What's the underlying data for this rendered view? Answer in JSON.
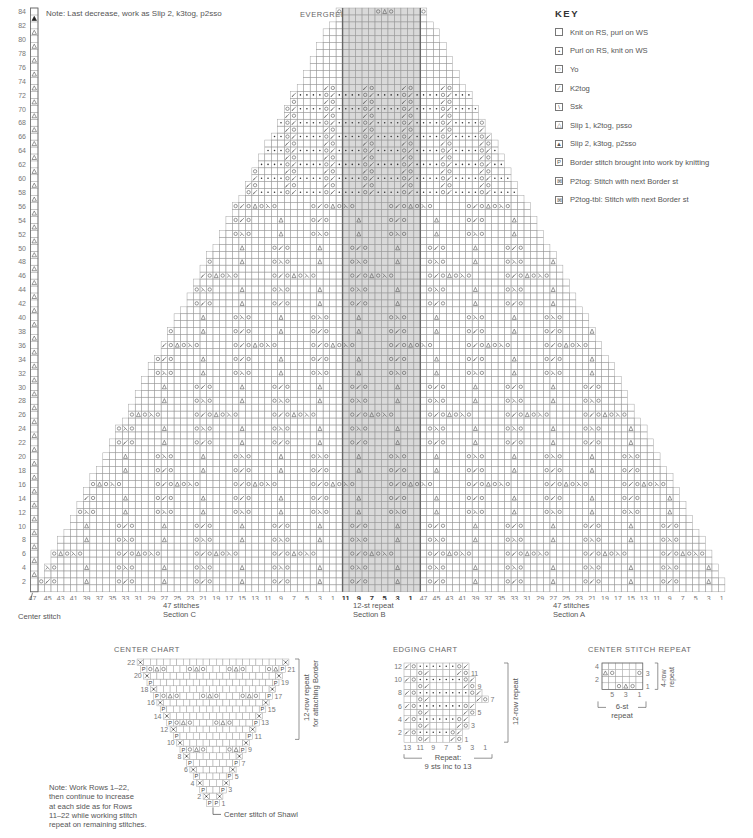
{
  "main_chart": {
    "title": "EVERGREEN BORDER CHART",
    "note": "Note: Last decrease, work as Slip 2, k3tog, p2sso",
    "row_labels": [
      "84",
      "82",
      "80",
      "78",
      "76",
      "74",
      "72",
      "70",
      "68",
      "66",
      "64",
      "62",
      "60",
      "58",
      "56",
      "54",
      "52",
      "50",
      "48",
      "46",
      "44",
      "42",
      "40",
      "38",
      "36",
      "34",
      "32",
      "30",
      "28",
      "26",
      "24",
      "22",
      "20",
      "18",
      "16",
      "14",
      "12",
      "10",
      "8",
      "6",
      "4",
      "2"
    ],
    "bottom_labels": {
      "section_c": [
        "47",
        "45",
        "43",
        "41",
        "39",
        "37",
        "35",
        "33",
        "31",
        "29",
        "27",
        "25",
        "23",
        "21",
        "19",
        "17",
        "15",
        "13",
        "11",
        "9",
        "7",
        "5",
        "3",
        "1"
      ],
      "section_b": [
        "11",
        "9",
        "7",
        "5",
        "3",
        "1"
      ],
      "section_a": [
        "47",
        "45",
        "43",
        "41",
        "39",
        "37",
        "35",
        "33",
        "31",
        "29",
        "27",
        "25",
        "23",
        "21",
        "19",
        "17",
        "15",
        "13",
        "11",
        "9",
        "7",
        "5",
        "3",
        "1"
      ]
    },
    "sections": {
      "c": {
        "line1": "47 stitches",
        "line2": "Section C"
      },
      "b": {
        "line1": "12-st repeat",
        "line2": "Section B"
      },
      "a": {
        "line1": "47 stitches",
        "line2": "Section A"
      }
    },
    "center_stitch_label": "Center stitch"
  },
  "key": {
    "title": "KEY",
    "items": [
      {
        "symbol": "knit",
        "label": "Knit on RS, purl on WS"
      },
      {
        "symbol": "purl",
        "label": "Purl on RS, knit on WS"
      },
      {
        "symbol": "yo",
        "label": "Yo"
      },
      {
        "symbol": "k2tog",
        "label": "K2tog"
      },
      {
        "symbol": "ssk",
        "label": "Ssk"
      },
      {
        "symbol": "sk2p",
        "label": "Slip 1, k2tog, psso"
      },
      {
        "symbol": "s2k3p",
        "label": "Slip 2, k3tog, p2sso"
      },
      {
        "symbol": "border",
        "label": "Border stitch brought into work by knitting"
      },
      {
        "symbol": "p2tog",
        "label": "P2tog: Stitch with next Border st"
      },
      {
        "symbol": "p2tog-tbl",
        "label": "P2tog-tbl: Stitch with next Border st"
      }
    ]
  },
  "center_chart": {
    "title": "CENTER CHART",
    "left_rows": [
      "22",
      "20",
      "18",
      "16",
      "14",
      "12",
      "10",
      "8",
      "6",
      "4",
      "2"
    ],
    "right_rows": [
      "21",
      "19",
      "17",
      "15",
      "13",
      "11",
      "9",
      "7",
      "5",
      "3",
      "1"
    ],
    "repeat_label_1": "12-row repeat",
    "repeat_label_2": "for attaching Border",
    "note": "Note: Work Rows 1–22, then continue to increase at each side as for Rows 11–22 while working stitch repeat on remaining stitches.",
    "note_lines": [
      "Note: Work Rows 1–22,",
      "then continue to increase",
      "at each side as for Rows",
      "11–22 while working stitch",
      "repeat on remaining stitches."
    ],
    "center_label": "Center stitch of Shawl"
  },
  "edging_chart": {
    "title": "EDGING CHART",
    "left_rows": [
      "12",
      "10",
      "8",
      "6",
      "4",
      "2"
    ],
    "right_rows": [
      "11",
      "9",
      "7",
      "5",
      "3",
      "1"
    ],
    "bottom_labels": [
      "13",
      "11",
      "9",
      "7",
      "5",
      "3",
      "1"
    ],
    "repeat_side_label": "12-row repeat",
    "repeat_line1": "Repeat:",
    "repeat_line2": "9 sts inc to 13"
  },
  "center_stitch_repeat": {
    "title": "CENTER STITCH REPEAT",
    "left_rows": [
      "4",
      "2"
    ],
    "right_rows": [
      "3",
      "1"
    ],
    "bottom_labels": [
      "5",
      "3",
      "1"
    ],
    "side_label_1": "4-row",
    "side_label_2": "repeat",
    "repeat_line1": "6-st",
    "repeat_line2": "repeat"
  },
  "colors": {
    "grid": "#9a9a9a",
    "grid_dark": "#666666",
    "shade": "#d9d9d9",
    "text": "#555555"
  }
}
